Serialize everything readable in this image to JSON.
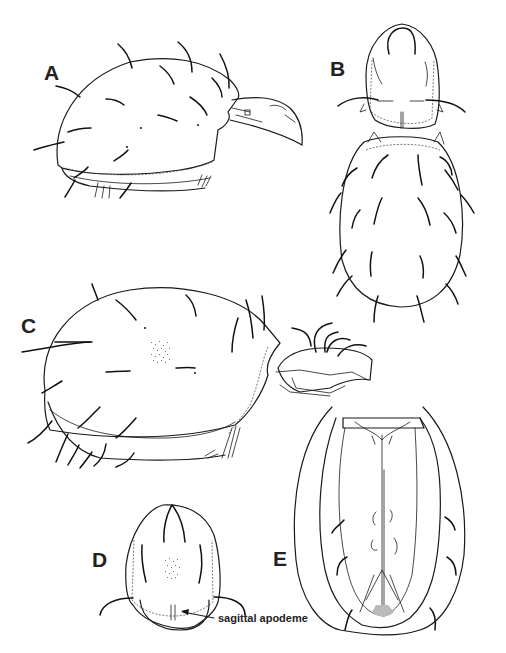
{
  "figure": {
    "background": "#ffffff",
    "ink_color": "#1a1a1a",
    "panels": [
      {
        "id": "A",
        "label": "A",
        "view": "lateral view, body with chelicera"
      },
      {
        "id": "B",
        "label": "B",
        "view": "dorsal view, prodorsum and hysterosoma"
      },
      {
        "id": "C",
        "label": "C",
        "view": "lateral view, body with gnathosoma"
      },
      {
        "id": "D",
        "label": "D",
        "view": "prodorsum, dorsal view"
      },
      {
        "id": "E",
        "label": "E",
        "view": "ventral view"
      }
    ],
    "annotations": [
      {
        "panel": "D",
        "text": "sagittal apodeme"
      }
    ]
  }
}
